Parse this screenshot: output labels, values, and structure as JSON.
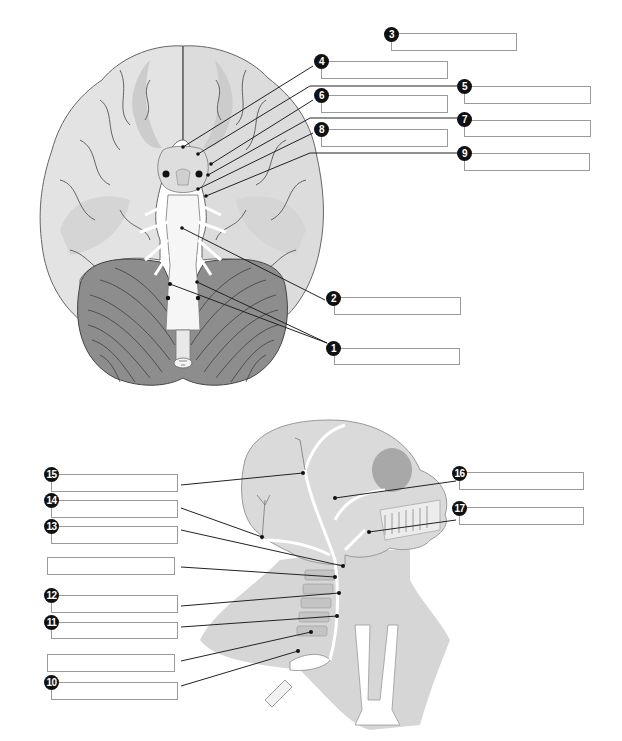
{
  "diagram": {
    "top_figure": "Inferior view of the brain showing cranial nerve origins",
    "bottom_figure": "Lateral view of the head and neck showing nerves",
    "colors": {
      "background": "#ffffff",
      "brain_fill": "#e2e2e2",
      "brain_shade": "#cfcfcf",
      "cerebellum": "#8a8a8a",
      "brainstem": "#f4f4f4",
      "leader_line": "#222222",
      "badge": "#111111",
      "box_border": "#9a9a9a"
    }
  },
  "labels": [
    {
      "number": "1",
      "value": ""
    },
    {
      "number": "2",
      "value": ""
    },
    {
      "number": "3",
      "value": ""
    },
    {
      "number": "4",
      "value": ""
    },
    {
      "number": "5",
      "value": ""
    },
    {
      "number": "6",
      "value": ""
    },
    {
      "number": "7",
      "value": ""
    },
    {
      "number": "8",
      "value": ""
    },
    {
      "number": "9",
      "value": ""
    },
    {
      "number": "10",
      "value": ""
    },
    {
      "number": "11",
      "value": ""
    },
    {
      "number": "12",
      "value": ""
    },
    {
      "number": "13",
      "value": ""
    },
    {
      "number": "14",
      "value": ""
    },
    {
      "number": "15",
      "value": ""
    },
    {
      "number": "16",
      "value": ""
    },
    {
      "number": "17",
      "value": ""
    }
  ],
  "unnumbered_boxes": [
    {
      "id": "a",
      "value": ""
    },
    {
      "id": "b",
      "value": ""
    }
  ]
}
